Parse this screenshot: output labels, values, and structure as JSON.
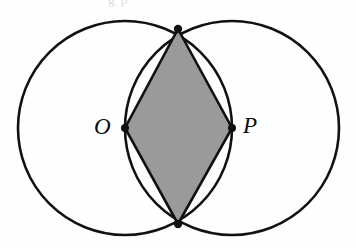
{
  "figure": {
    "background_color": "#fefefe",
    "stroke_color": "#111111",
    "shaded_region_color": "#9a9a9a",
    "label_color": "#0b0b0b",
    "clipped_caption_remnant": "g p"
  },
  "labels": {
    "left_center": "O",
    "right_center": "P"
  },
  "geometry": {
    "circles": [
      {
        "name": "left-circle",
        "cx": 125,
        "cy": 128,
        "r": 107
      },
      {
        "name": "right-circle",
        "cx": 232,
        "cy": 128,
        "r": 107
      }
    ],
    "points": [
      {
        "name": "O",
        "x": 125,
        "y": 128
      },
      {
        "name": "P",
        "x": 232,
        "y": 128
      },
      {
        "name": "top-intersection",
        "x": 178,
        "y": 29
      },
      {
        "name": "bottom-intersection",
        "x": 178,
        "y": 224
      }
    ],
    "rhombus_vertices": [
      {
        "x": 178,
        "y": 29
      },
      {
        "x": 232,
        "y": 128
      },
      {
        "x": 178,
        "y": 224
      },
      {
        "x": 125,
        "y": 128
      }
    ],
    "stroke_width": 2.6,
    "dot_radius": 4.0
  },
  "chart_data": {
    "type": "diagram",
    "shapes": [
      {
        "type": "circle",
        "label": "left circle centered at O",
        "cx": 125,
        "cy": 128,
        "r": 107,
        "fill": "none",
        "stroke": "#111111"
      },
      {
        "type": "circle",
        "label": "right circle centered at P",
        "cx": 232,
        "cy": 128,
        "r": 107,
        "fill": "none",
        "stroke": "#111111"
      },
      {
        "type": "polygon",
        "label": "shaded rhombus O-top-P-bottom",
        "points": [
          [
            178,
            29
          ],
          [
            232,
            128
          ],
          [
            178,
            224
          ],
          [
            125,
            128
          ]
        ],
        "fill": "#9a9a9a",
        "stroke": "#111111"
      }
    ],
    "annotations": [
      {
        "text": "O",
        "x": 125,
        "y": 128,
        "placement": "left-of-point",
        "style": "italic-serif"
      },
      {
        "text": "P",
        "x": 232,
        "y": 128,
        "placement": "right-of-point",
        "style": "italic-serif"
      }
    ]
  }
}
